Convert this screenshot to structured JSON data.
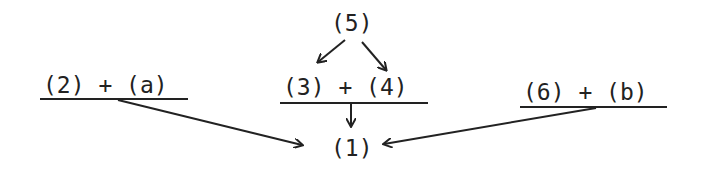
{
  "diagram": {
    "nodes": {
      "n5": "(5)",
      "left": "(2) + (a)",
      "center": "(3) + (4)",
      "right": "(6) + (b)",
      "n1": "(1)"
    },
    "edges": [
      {
        "from": "(5)",
        "to": "(3)"
      },
      {
        "from": "(5)",
        "to": "(4)"
      },
      {
        "from": "(3) + (4)",
        "to": "(1)"
      },
      {
        "from": "(2) + (a)",
        "to": "(1)"
      },
      {
        "from": "(6) + (b)",
        "to": "(1)"
      }
    ],
    "colors": {
      "ink": "#222222",
      "background": "#ffffff"
    }
  }
}
